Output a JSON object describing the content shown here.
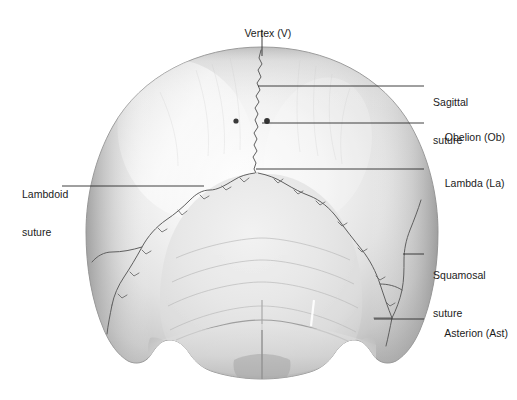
{
  "figure": {
    "view": "posterior (occipital) view",
    "background_color": "#ffffff",
    "leader_line_color": "#2b2b2b",
    "text_color": "#1b1b1b",
    "bone_light": "#fbfbfb",
    "bone_mid": "#d6d6d6",
    "bone_dark": "#9a9a9a",
    "suture_color": "#6d6d6d",
    "landmark_dot_color": "#3a3a3a"
  },
  "labels": [
    {
      "id": "vertex",
      "text": "Vertex (V)",
      "abbr": "V",
      "side": "top",
      "text_x": 262,
      "text_y": 14,
      "leader": {
        "x1": 262,
        "y1": 30,
        "x2": 262,
        "y2": 56
      }
    },
    {
      "id": "sagittal-suture",
      "line1": "Sagittal",
      "line2": "suture",
      "side": "right",
      "text_x": 433,
      "text_y": 71,
      "leader": {
        "x1": 424,
        "y1": 86,
        "x2": 258,
        "y2": 86
      }
    },
    {
      "id": "obelion",
      "text": "Obelion (Ob)",
      "abbr": "Ob",
      "side": "right",
      "text_x": 433,
      "text_y": 118,
      "leader": {
        "x1": 424,
        "y1": 123,
        "x2": 262,
        "y2": 123
      }
    },
    {
      "id": "lambdoid-suture",
      "line1": "Lambdoid",
      "line2": "suture",
      "side": "left",
      "text_x": 22,
      "text_y": 163,
      "leader": {
        "x1": 62,
        "y1": 186,
        "x2": 204,
        "y2": 186
      }
    },
    {
      "id": "lambda",
      "text": "Lambda (La)",
      "abbr": "La",
      "side": "right",
      "text_x": 433,
      "text_y": 164,
      "leader": {
        "x1": 424,
        "y1": 169,
        "x2": 256,
        "y2": 169
      }
    },
    {
      "id": "squamosal-suture",
      "line1": "Squamosal",
      "line2": "suture",
      "side": "right",
      "text_x": 433,
      "text_y": 244,
      "leader": {
        "x1": 424,
        "y1": 254,
        "x2": 403,
        "y2": 254
      }
    },
    {
      "id": "asterion",
      "text": "Asterion (Ast)",
      "abbr": "Ast",
      "side": "right",
      "text_x": 433,
      "text_y": 314,
      "leader": {
        "x1": 424,
        "y1": 319,
        "x2": 374,
        "y2": 319
      }
    }
  ],
  "landmarks": {
    "obelion_dots": [
      {
        "cx": 236,
        "cy": 121,
        "r": 2.6
      },
      {
        "cx": 267,
        "cy": 121,
        "r": 2.9
      }
    ]
  }
}
